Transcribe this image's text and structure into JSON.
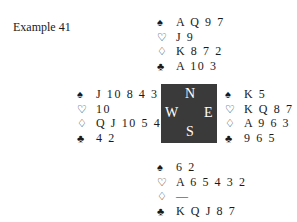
{
  "title": "Example 41",
  "suits": {
    "spades": "♠",
    "hearts": "♡",
    "diamonds": "♢",
    "clubs": "♣"
  },
  "compass": {
    "north": "N",
    "west": "W",
    "east": "E",
    "south": "S"
  },
  "hands": {
    "north": {
      "spades": "A Q 9 7",
      "hearts": "J 9",
      "diamonds": "K 8 7 2",
      "clubs": "A 10 3"
    },
    "west": {
      "spades": "J 10 8 4 3",
      "hearts": "10",
      "diamonds": "Q J 10 5 4",
      "clubs": "4 2"
    },
    "east": {
      "spades": "K 5",
      "hearts": "K Q 8 7",
      "diamonds": "A 9 6 3",
      "clubs": "9 6 5"
    },
    "south": {
      "spades": "6 2",
      "hearts": "A 6 5 4 3 2",
      "diamonds": "—",
      "clubs": "K Q J 8 7"
    }
  }
}
